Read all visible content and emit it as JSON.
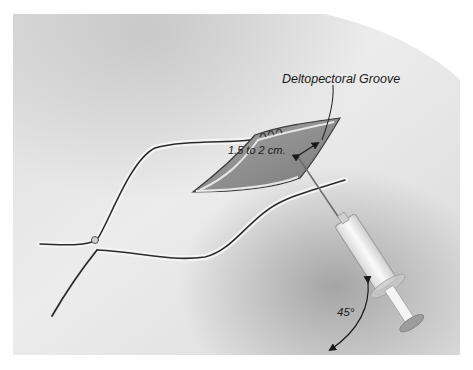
{
  "figure": {
    "labels": {
      "groove": "Deltopectoral Groove",
      "distance": "1.5 to 2 cm.",
      "angle": "45°"
    },
    "colors": {
      "background": "#ffffff",
      "skin_light": "#e9e9e9",
      "skin_mid": "#cfcfcf",
      "skin_shadow": "#a9a9a9",
      "vessel_outline": "#2a2a2a",
      "incision_inner": "#8e8e8e",
      "syringe_body": "#f2f2f2",
      "text": "#1a1a1a"
    }
  }
}
